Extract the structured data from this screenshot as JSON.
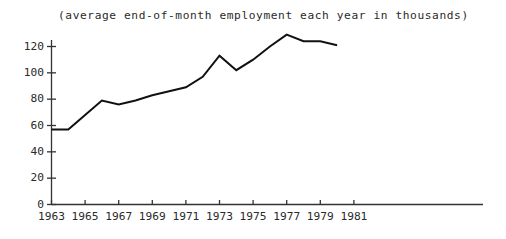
{
  "chart_data": {
    "type": "line",
    "title": "(average end-of-month employment each year in thousands)",
    "xlabel": "",
    "ylabel": "",
    "x": [
      1963,
      1964,
      1965,
      1966,
      1967,
      1968,
      1969,
      1970,
      1971,
      1972,
      1973,
      1974,
      1975,
      1976,
      1977,
      1978,
      1979,
      1980
    ],
    "values": [
      57,
      57,
      68,
      79,
      76,
      79,
      83,
      86,
      89,
      97,
      113,
      102,
      110,
      120,
      129,
      124,
      124,
      121
    ],
    "series": [
      {
        "name": "employment",
        "values": [
          57,
          57,
          68,
          79,
          76,
          79,
          83,
          86,
          89,
          97,
          113,
          102,
          110,
          120,
          129,
          124,
          124,
          121
        ]
      }
    ],
    "xlim": [
      1963,
      1982
    ],
    "ylim": [
      0,
      130
    ],
    "yticks": [
      0,
      20,
      40,
      60,
      80,
      100,
      120
    ],
    "ytick_labels": [
      "0",
      "20",
      "40",
      "60",
      "80",
      "100",
      "120"
    ],
    "xticks": [
      1963,
      1965,
      1967,
      1969,
      1971,
      1973,
      1975,
      1977,
      1979,
      1981
    ],
    "xtick_labels": [
      "1963",
      "1965",
      "1967",
      "1969",
      "1971",
      "1973",
      "1975",
      "1977",
      "1979",
      "1981"
    ],
    "grid": false,
    "legend": "none",
    "line_color": "#111111",
    "line_width": 2.0,
    "axis_color": "#333333"
  }
}
